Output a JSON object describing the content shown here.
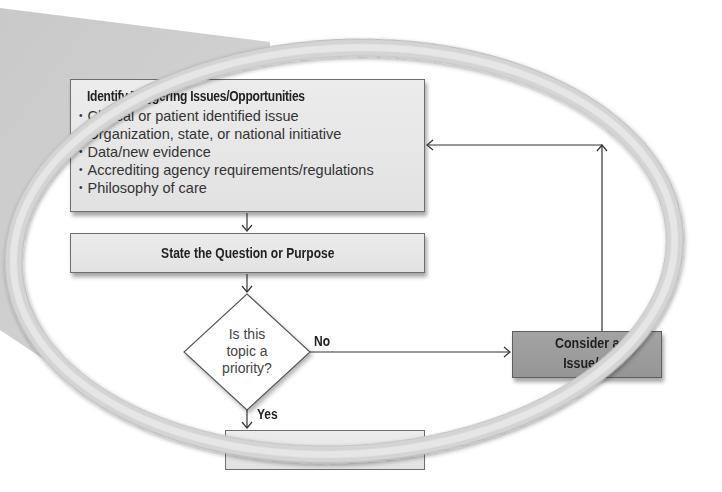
{
  "diagram": {
    "type": "flowchart-magnified-detail",
    "colors": {
      "background": "#ffffff",
      "box_fill": "#e6e6e6",
      "box_border": "#6e6e6e",
      "dark_box_fill": "#9c9c9c",
      "ring": "#d9d9d9",
      "wedge": "#cfcfcf",
      "line": "#333333"
    },
    "nodes": {
      "triggers": {
        "title_visible": "ntify Triggering Issues/Opportunities",
        "title_full": "Identify Triggering Issues/Opportunities",
        "bullets": [
          "Clinical or patient identified issue",
          "Organization, state, or national initiative",
          "Data/new evidence",
          "Accrediting agency requirements/regulations",
          "Philosophy of care"
        ]
      },
      "question": {
        "title": "State the Question or Purpose"
      },
      "priority": {
        "shape": "diamond",
        "lines": [
          "Is this",
          "topic a",
          "priority?"
        ]
      },
      "consider": {
        "line1_visible": "Consider a",
        "line2_visible": "Issue/o"
      },
      "next_step": {
        "title": ""
      }
    },
    "edges": [
      {
        "from": "triggers",
        "to": "question",
        "label": ""
      },
      {
        "from": "question",
        "to": "priority",
        "label": ""
      },
      {
        "from": "priority",
        "to": "consider",
        "label": "No"
      },
      {
        "from": "priority",
        "to": "next_step",
        "label": "Yes"
      },
      {
        "from": "consider",
        "to": "triggers",
        "label": ""
      }
    ],
    "labels": {
      "no": "No",
      "yes": "Yes"
    }
  }
}
